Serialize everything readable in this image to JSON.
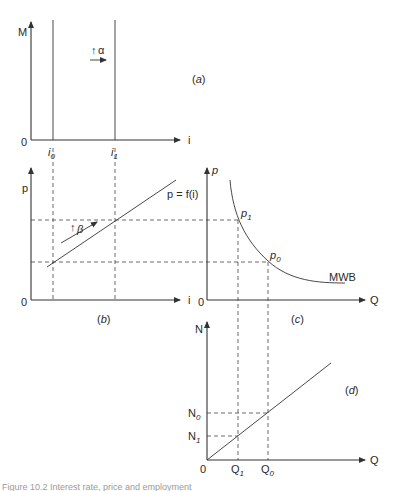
{
  "figure": {
    "panels": {
      "a": {
        "tag": "(a)",
        "y_axis_label": "M",
        "x_axis_label": "i",
        "origin": "0",
        "ticks": {
          "i0": "i",
          "i0_sub": "0",
          "i1": "i",
          "i1_sub": "1"
        },
        "shift_annotation": {
          "symbol": "↑",
          "greek": "α"
        }
      },
      "b": {
        "tag": "(b)",
        "y_axis_label": "p",
        "x_axis_label": "i",
        "origin": "0",
        "curve_label": "p = f(i)",
        "shift_annotation": {
          "symbol": "↑",
          "greek": "β"
        }
      },
      "c": {
        "tag": "(c)",
        "y_axis_label": "p",
        "x_axis_label": "Q",
        "origin": "0",
        "curve_label": "MWB",
        "points": {
          "p1": "p",
          "p1_sub": "1",
          "p0": "p",
          "p0_sub": "0"
        }
      },
      "d": {
        "tag": "(d)",
        "y_axis_label": "N",
        "x_axis_label": "Q",
        "origin": "0",
        "y_ticks": {
          "n0": "N",
          "n0_sub": "0",
          "n1": "N",
          "n1_sub": "1"
        },
        "x_ticks": {
          "q1": "Q",
          "q1_sub": "1",
          "q0": "Q",
          "q0_sub": "0"
        }
      }
    },
    "caption": "Figure 10.2  Interest rate, price and employment"
  },
  "colors": {
    "ink": "#2a2a2a",
    "background": "#ffffff"
  }
}
